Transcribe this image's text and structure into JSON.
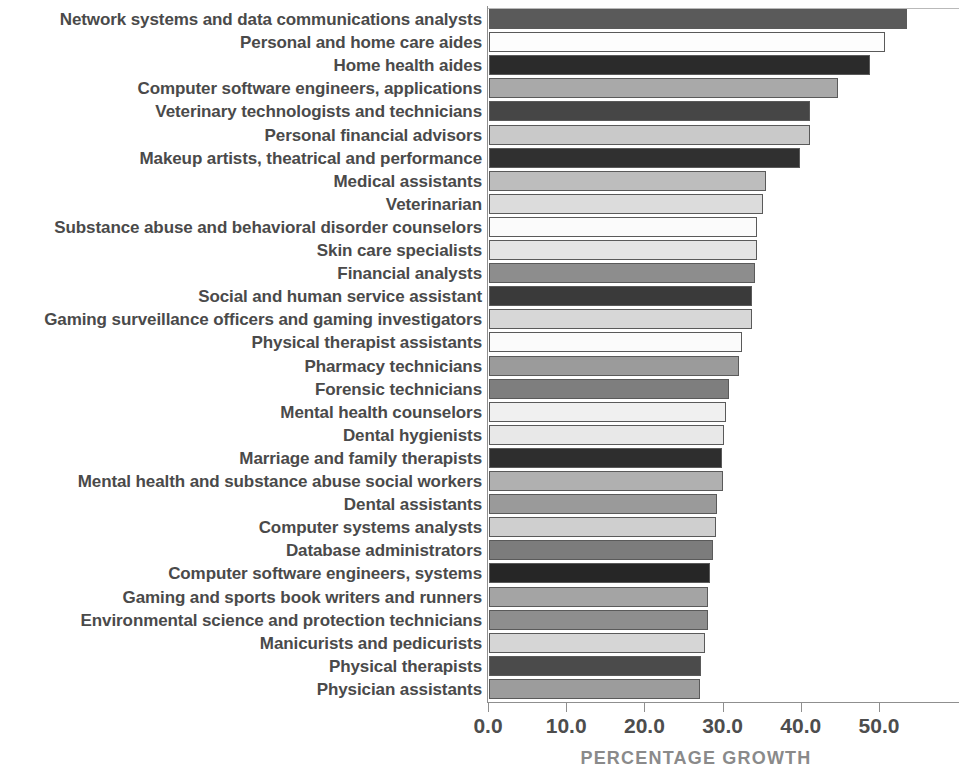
{
  "chart_data": {
    "type": "bar",
    "orientation": "horizontal",
    "title": "",
    "xlabel": "PERCENTAGE GROWTH",
    "ylabel": "",
    "xlim": [
      0,
      60.4
    ],
    "xticks": [
      "0.0",
      "10.0",
      "20.0",
      "30.0",
      "40.0",
      "50.0"
    ],
    "xtick_values": [
      0,
      10,
      20,
      30,
      40,
      50
    ],
    "grid": false,
    "legend": false,
    "categories": [
      "Network systems and data communications analysts",
      "Personal and home care aides",
      "Home health aides",
      "Computer software engineers, applications",
      "Veterinary technologists and technicians",
      "Personal financial advisors",
      "Makeup artists, theatrical and performance",
      "Medical assistants",
      "Veterinarian",
      "Substance abuse and behavioral disorder counselors",
      "Skin care specialists",
      "Financial analysts",
      "Social and human service assistant",
      "Gaming surveillance officers and gaming investigators",
      "Physical therapist assistants",
      "Pharmacy technicians",
      "Forensic technicians",
      "Mental health counselors",
      "Dental hygienists",
      "Marriage and family therapists",
      "Mental health and substance abuse social workers",
      "Dental assistants",
      "Computer systems analysts",
      "Database administrators",
      "Computer software engineers, systems",
      "Gaming and sports book writers and runners",
      "Environmental science and protection technicians",
      "Manicurists and pedicurists",
      "Physical therapists",
      "Physician assistants"
    ],
    "values": [
      53.4,
      50.6,
      48.7,
      44.6,
      41.0,
      41.0,
      39.8,
      35.4,
      35.0,
      34.3,
      34.3,
      34.0,
      33.6,
      33.6,
      32.4,
      32.0,
      30.7,
      30.3,
      30.1,
      29.8,
      29.9,
      29.2,
      29.0,
      28.6,
      28.2,
      28.0,
      28.0,
      27.6,
      27.1,
      27.0
    ],
    "bar_colors": [
      "#5a5a5a",
      "#fdfdfd",
      "#2b2b2b",
      "#a9a9a9",
      "#464646",
      "#c9c9c9",
      "#303030",
      "#bdbdbd",
      "#dcdcdc",
      "#fbfbfb",
      "#e4e4e4",
      "#8d8d8d",
      "#3a3a3a",
      "#d7d7d7",
      "#fbfbfb",
      "#9b9b9b",
      "#7e7e7e",
      "#f0f0f0",
      "#e8e8e8",
      "#2e2e2e",
      "#b0b0b0",
      "#9a9a9a",
      "#cfcfcf",
      "#7c7c7c",
      "#262626",
      "#a4a4a4",
      "#8e8e8e",
      "#d6d6d6",
      "#4b4b4b",
      "#9c9c9c"
    ]
  }
}
